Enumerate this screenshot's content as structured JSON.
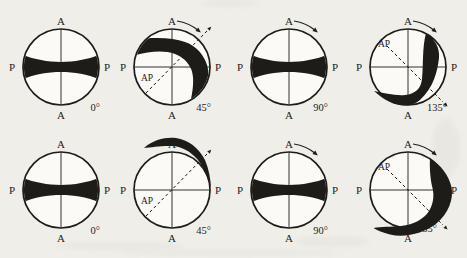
{
  "colors": {
    "ink": "#1e1c19",
    "background": "#f0eee9",
    "circle_fill": "#fbfaf6"
  },
  "panels": [
    {
      "id": "row1-0deg",
      "axis_top": "A",
      "axis_bottom": "A",
      "axis_left": "P",
      "axis_right": "P",
      "angle_label": "0°",
      "ap_label": null,
      "ap_direction": null,
      "rotation_arrow": false,
      "isogyre": "bowtie"
    },
    {
      "id": "row1-45deg",
      "axis_top": "A",
      "axis_bottom": "A",
      "axis_left": "P",
      "axis_right": "P",
      "angle_label": "45°",
      "ap_label": "AP",
      "ap_direction": "ne",
      "rotation_arrow": true,
      "isogyre": "bent-band"
    },
    {
      "id": "row1-90deg",
      "axis_top": "A",
      "axis_bottom": "A",
      "axis_left": "P",
      "axis_right": "P",
      "angle_label": "90°",
      "ap_label": null,
      "ap_direction": null,
      "rotation_arrow": true,
      "isogyre": "bowtie"
    },
    {
      "id": "row1-135deg",
      "axis_top": "A",
      "axis_bottom": "A",
      "axis_left": "P",
      "axis_right": "P",
      "angle_label": "135°",
      "ap_label": "AP",
      "ap_direction": "se",
      "rotation_arrow": true,
      "isogyre": "banana"
    },
    {
      "id": "row2-0deg",
      "axis_top": "A",
      "axis_bottom": "A",
      "axis_left": "P",
      "axis_right": "P",
      "angle_label": "0°",
      "ap_label": null,
      "ap_direction": null,
      "rotation_arrow": false,
      "isogyre": "bowtie"
    },
    {
      "id": "row2-45deg",
      "axis_top": "A",
      "axis_bottom": "A",
      "axis_left": "P",
      "axis_right": "P",
      "angle_label": "45°",
      "ap_label": "AP",
      "ap_direction": "ne",
      "rotation_arrow": true,
      "isogyre": "crescent-top"
    },
    {
      "id": "row2-90deg",
      "axis_top": "A",
      "axis_bottom": "A",
      "axis_left": "P",
      "axis_right": "P",
      "angle_label": "90°",
      "ap_label": null,
      "ap_direction": null,
      "rotation_arrow": true,
      "isogyre": "bowtie"
    },
    {
      "id": "row2-135deg",
      "axis_top": "A",
      "axis_bottom": "A",
      "axis_left": "P",
      "axis_right": "P",
      "angle_label": "135°",
      "ap_label": "AP",
      "ap_direction": "se",
      "rotation_arrow": true,
      "isogyre": "crescent-right"
    }
  ]
}
